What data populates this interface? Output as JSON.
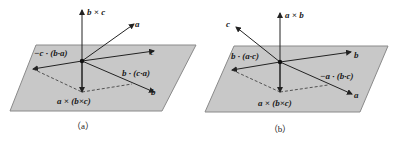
{
  "figure": {
    "panels": [
      {
        "id": "a",
        "caption": "（a）",
        "labels": {
          "normal": "b × c",
          "vec_a": "a",
          "vec_c": "c",
          "vec_b": "b",
          "proj_left": "−c · (b·a)",
          "proj_right": "b · (c·a)",
          "triple": "a × (b×c)"
        }
      },
      {
        "id": "b",
        "caption": "（b）",
        "labels": {
          "normal": "a × b",
          "vec_c": "c",
          "vec_b": "b",
          "vec_a": "a",
          "proj_left": "b · (a·c)",
          "proj_right": "−a · (b·c)",
          "triple": "a × (b×c)"
        }
      }
    ],
    "colors": {
      "plane": "#c8c8c8",
      "plane_edge": "#8a8a8a",
      "vector": "#222222"
    }
  }
}
